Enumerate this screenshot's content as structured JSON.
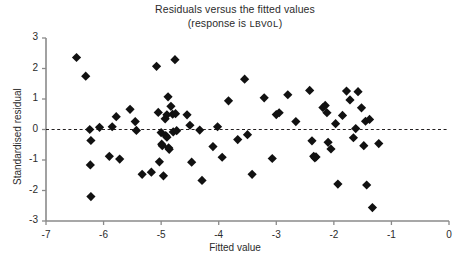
{
  "chart_data": {
    "type": "scatter",
    "title": "Residuals versus the fitted values",
    "subtitle_prefix": "(response is ",
    "subtitle_variable": "LBVOL",
    "subtitle_suffix": ")",
    "xlabel": "Fitted value",
    "ylabel": "Standardised residual",
    "xlim": [
      -7,
      0
    ],
    "ylim": [
      -3,
      3
    ],
    "xticks": [
      -7,
      -6,
      -5,
      -4,
      -3,
      -2,
      -1,
      0
    ],
    "xtick_labels": [
      "-7",
      "-6",
      "-5",
      "-4",
      "-3",
      "-2",
      "-1",
      "0"
    ],
    "yticks": [
      -3,
      -2,
      -1,
      0,
      1,
      2,
      3
    ],
    "ytick_labels": [
      "-3",
      "-2",
      "-1",
      "0",
      "1",
      "2",
      "3"
    ],
    "grid": false,
    "reference_line": {
      "orientation": "horizontal",
      "y": 0,
      "style": "dashed",
      "color": "#231f20"
    },
    "marker": {
      "shape": "diamond",
      "color": "#111111",
      "size": 4.6
    },
    "axis_color": "#8a8a8a",
    "legend": null,
    "n_points": 97,
    "points": [
      [
        -6.47,
        2.36
      ],
      [
        -6.31,
        1.75
      ],
      [
        -6.24,
        0.0
      ],
      [
        -6.22,
        -0.36
      ],
      [
        -6.23,
        -1.16
      ],
      [
        -6.22,
        -2.2
      ],
      [
        -6.07,
        0.07
      ],
      [
        -5.9,
        -0.88
      ],
      [
        -5.85,
        0.09
      ],
      [
        -5.78,
        0.42
      ],
      [
        -5.72,
        -0.97
      ],
      [
        -5.54,
        0.66
      ],
      [
        -5.45,
        0.26
      ],
      [
        -5.43,
        -0.03
      ],
      [
        -5.33,
        -1.47
      ],
      [
        -5.17,
        -1.4
      ],
      [
        -5.08,
        2.07
      ],
      [
        -5.05,
        0.56
      ],
      [
        -5.03,
        -1.06
      ],
      [
        -5.0,
        -0.1
      ],
      [
        -4.99,
        -0.48
      ],
      [
        -4.98,
        -0.53
      ],
      [
        -4.96,
        -1.52
      ],
      [
        -4.93,
        0.35
      ],
      [
        -4.92,
        -0.2
      ],
      [
        -4.9,
        -0.25
      ],
      [
        -4.9,
        0.48
      ],
      [
        -4.88,
        1.07
      ],
      [
        -4.87,
        -0.6
      ],
      [
        -4.86,
        -0.65
      ],
      [
        -4.83,
        0.76
      ],
      [
        -4.8,
        0.5
      ],
      [
        -4.79,
        -0.08
      ],
      [
        -4.76,
        2.29
      ],
      [
        -4.75,
        0.52
      ],
      [
        -4.73,
        -0.04
      ],
      [
        -4.55,
        0.48
      ],
      [
        -4.5,
        0.14
      ],
      [
        -4.47,
        -1.07
      ],
      [
        -4.33,
        -0.02
      ],
      [
        -4.29,
        -1.67
      ],
      [
        -4.1,
        -0.56
      ],
      [
        -4.02,
        0.09
      ],
      [
        -3.94,
        -0.91
      ],
      [
        -3.83,
        0.94
      ],
      [
        -3.67,
        -0.33
      ],
      [
        -3.55,
        1.65
      ],
      [
        -3.5,
        -0.17
      ],
      [
        -3.42,
        -1.47
      ],
      [
        -3.21,
        1.04
      ],
      [
        -3.07,
        -0.95
      ],
      [
        -3.0,
        0.49
      ],
      [
        -2.95,
        0.55
      ],
      [
        -2.8,
        1.14
      ],
      [
        -2.66,
        0.26
      ],
      [
        -2.42,
        1.28
      ],
      [
        -2.38,
        -0.37
      ],
      [
        -2.35,
        -0.88
      ],
      [
        -2.33,
        -0.93
      ],
      [
        -2.31,
        -0.9
      ],
      [
        -2.19,
        0.72
      ],
      [
        -2.15,
        0.79
      ],
      [
        -2.12,
        0.55
      ],
      [
        -2.1,
        -0.42
      ],
      [
        -2.05,
        -0.64
      ],
      [
        -1.97,
        0.19
      ],
      [
        -1.93,
        -1.79
      ],
      [
        -1.85,
        0.46
      ],
      [
        -1.78,
        1.26
      ],
      [
        -1.72,
        0.97
      ],
      [
        -1.66,
        -0.27
      ],
      [
        -1.62,
        0.03
      ],
      [
        -1.58,
        1.24
      ],
      [
        -1.52,
        0.71
      ],
      [
        -1.48,
        -0.53
      ],
      [
        -1.45,
        0.27
      ],
      [
        -1.43,
        -1.82
      ],
      [
        -1.38,
        0.33
      ],
      [
        -1.33,
        -2.56
      ],
      [
        -1.22,
        -0.46
      ]
    ]
  }
}
